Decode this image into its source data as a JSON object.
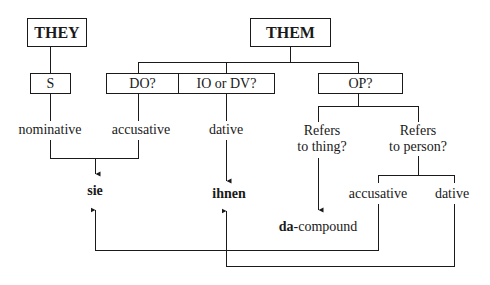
{
  "diagram": {
    "pronouns": {
      "they": "THEY",
      "them": "THEM"
    },
    "functions": {
      "subject": "S",
      "direct_object": "DO?",
      "indirect_object": "IO or DV?",
      "object_of_preposition": "OP?"
    },
    "cases": {
      "nominative": "nominative",
      "accusative": "accusative",
      "dative": "dative",
      "accusative_person": "accusative",
      "dative_person": "dative"
    },
    "questions": {
      "thing_line1": "Refers",
      "thing_line2": "to thing?",
      "person_line1": "Refers",
      "person_line2": "to person?"
    },
    "results": {
      "sie": "sie",
      "ihnen": "ihnen",
      "da_prefix": "da",
      "da_suffix": "-compound"
    },
    "colors": {
      "line": "#1a1a1a",
      "background": "#ffffff"
    }
  }
}
